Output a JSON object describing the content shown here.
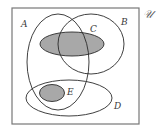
{
  "diagram": {
    "type": "venn",
    "universe": {
      "label": "𝒰",
      "rect": {
        "x": 12,
        "y": 8,
        "width": 127,
        "height": 116
      },
      "stroke": "#777777",
      "label_pos": {
        "x": 143,
        "y": 18
      }
    },
    "sets": [
      {
        "id": "A",
        "label": "A",
        "shape": "ellipse",
        "cx": 58,
        "cy": 62,
        "rx": 31,
        "ry": 48,
        "fill": "none",
        "stroke": "#2a2a2a",
        "label_pos": {
          "x": 21,
          "y": 27
        }
      },
      {
        "id": "B",
        "label": "B",
        "shape": "ellipse",
        "cx": 91,
        "cy": 44,
        "rx": 33,
        "ry": 30,
        "fill": "none",
        "stroke": "#2a2a2a",
        "label_pos": {
          "x": 121,
          "y": 25
        }
      },
      {
        "id": "C",
        "label": "C",
        "shape": "ellipse",
        "cx": 72,
        "cy": 44,
        "rx": 32,
        "ry": 12,
        "fill": "#a8a8a8",
        "stroke": "#2a2a2a",
        "label_pos": {
          "x": 90,
          "y": 32
        }
      },
      {
        "id": "D",
        "label": "D",
        "shape": "ellipse",
        "cx": 69,
        "cy": 98,
        "rx": 43,
        "ry": 18,
        "fill": "none",
        "stroke": "#2a2a2a",
        "label_pos": {
          "x": 114,
          "y": 109
        }
      },
      {
        "id": "E",
        "label": "E",
        "shape": "ellipse",
        "cx": 52,
        "cy": 93,
        "rx": 12.5,
        "ry": 8.5,
        "fill": "#a8a8a8",
        "stroke": "#2a2a2a",
        "label_pos": {
          "x": 67,
          "y": 95
        }
      }
    ],
    "shaded_sets": [
      "C",
      "E"
    ],
    "shade_color": "#a8a8a8",
    "line_color": "#2a2a2a"
  }
}
